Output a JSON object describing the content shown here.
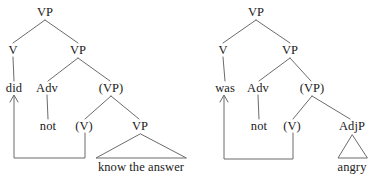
{
  "figure": {
    "kind": "syntax-tree-diagram",
    "line_color": "#6b6b6b",
    "text_color": "#1a1a1a",
    "background_color": "#ffffff"
  },
  "trees": [
    {
      "id": "tree-did",
      "name": "did-not-know-the-answer",
      "nodes": [
        {
          "id": "vp-top",
          "label": "VP",
          "x": 45,
          "y": 12,
          "type": "phrase"
        },
        {
          "id": "v-head",
          "label": "V",
          "x": 13,
          "y": 50,
          "type": "phrase"
        },
        {
          "id": "vp-mid",
          "label": "VP",
          "x": 78,
          "y": 50,
          "type": "phrase"
        },
        {
          "id": "did",
          "label": "did",
          "x": 14,
          "y": 88,
          "type": "leaf"
        },
        {
          "id": "adv",
          "label": "Adv",
          "x": 47,
          "y": 88,
          "type": "phrase"
        },
        {
          "id": "vp-trace",
          "label": "(VP)",
          "x": 111,
          "y": 88,
          "type": "phrase"
        },
        {
          "id": "not",
          "label": "not",
          "x": 48,
          "y": 126,
          "type": "leaf"
        },
        {
          "id": "v-trace",
          "label": "(V)",
          "x": 84,
          "y": 126,
          "type": "phrase"
        },
        {
          "id": "vp-low",
          "label": "VP",
          "x": 140,
          "y": 126,
          "type": "phrase"
        },
        {
          "id": "know",
          "label": "know the answer",
          "x": 141,
          "y": 167,
          "type": "leaf"
        }
      ],
      "triangle": {
        "apex_x": 140,
        "apex_y": 134,
        "left_x": 96,
        "right_x": 186,
        "base_y": 158
      },
      "movement": {
        "from_label": "(V)",
        "to_label": "did"
      }
    },
    {
      "id": "tree-was",
      "name": "was-not-angry",
      "nodes": [
        {
          "id": "vp-top",
          "label": "VP",
          "x": 256,
          "y": 12,
          "type": "phrase"
        },
        {
          "id": "v-head",
          "label": "V",
          "x": 223,
          "y": 50,
          "type": "phrase"
        },
        {
          "id": "vp-mid",
          "label": "VP",
          "x": 290,
          "y": 50,
          "type": "phrase"
        },
        {
          "id": "was",
          "label": "was",
          "x": 225,
          "y": 88,
          "type": "leaf"
        },
        {
          "id": "adv",
          "label": "Adv",
          "x": 258,
          "y": 88,
          "type": "phrase"
        },
        {
          "id": "vp-trace",
          "label": "(VP)",
          "x": 312,
          "y": 88,
          "type": "phrase"
        },
        {
          "id": "not",
          "label": "not",
          "x": 259,
          "y": 126,
          "type": "leaf"
        },
        {
          "id": "v-trace",
          "label": "(V)",
          "x": 292,
          "y": 126,
          "type": "phrase"
        },
        {
          "id": "adjp",
          "label": "AdjP",
          "x": 352,
          "y": 126,
          "type": "phrase"
        },
        {
          "id": "angry",
          "label": "angry",
          "x": 352,
          "y": 167,
          "type": "leaf"
        }
      ],
      "triangle": {
        "apex_x": 352,
        "apex_y": 135,
        "left_x": 338,
        "right_x": 367,
        "base_y": 158
      },
      "movement": {
        "from_label": "(V)",
        "to_label": "was"
      }
    }
  ]
}
